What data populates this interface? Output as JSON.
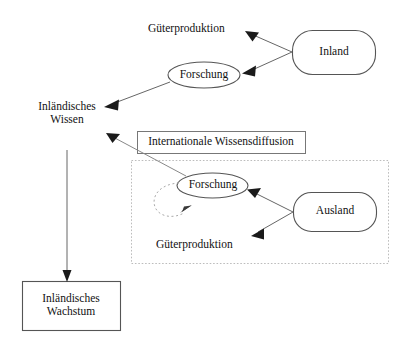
{
  "diagram": {
    "title": "Internationale Wissensdiffusion",
    "colors": {
      "stroke": "#555555",
      "text": "#111111",
      "arrow_fill": "#1a1a1a",
      "dotted_border": "#bbbbbb",
      "background": "#ffffff"
    },
    "nodes": {
      "inland": {
        "label": "Inland",
        "shape": "rounded-rectangle"
      },
      "ausland": {
        "label": "Ausland",
        "shape": "rounded-rectangle"
      },
      "inlaendisches_wissen": {
        "label": "Inländisches\nWissen",
        "shape": "text"
      },
      "inlaendisches_wachstum": {
        "label": "Inländisches\nWachstum",
        "shape": "rectangle"
      },
      "forschung_inland": {
        "label": "Forschung",
        "shape": "ellipse"
      },
      "forschung_ausland": {
        "label": "Forschung",
        "shape": "ellipse"
      },
      "gueterproduktion_inland": {
        "label": "Güterproduktion",
        "shape": "text"
      },
      "gueterproduktion_ausland": {
        "label": "Güterproduktion",
        "shape": "text"
      },
      "wissensdiffusion": {
        "label": "Internationale Wissensdiffusion",
        "shape": "rectangle"
      }
    },
    "edges": [
      {
        "from": "inland",
        "to": "gueterproduktion_inland",
        "style": "solid"
      },
      {
        "from": "inland",
        "to": "forschung_inland",
        "style": "solid"
      },
      {
        "from": "forschung_inland",
        "to": "inlaendisches_wissen",
        "style": "solid"
      },
      {
        "from": "forschung_ausland",
        "to": "inlaendisches_wissen",
        "style": "solid"
      },
      {
        "from": "ausland",
        "to": "forschung_ausland",
        "style": "solid"
      },
      {
        "from": "ausland",
        "to": "gueterproduktion_ausland",
        "style": "solid"
      },
      {
        "from": "forschung_ausland",
        "to": "forschung_ausland",
        "style": "dashed-loop"
      },
      {
        "from": "inlaendisches_wissen",
        "to": "inlaendisches_wachstum",
        "style": "solid"
      }
    ]
  }
}
